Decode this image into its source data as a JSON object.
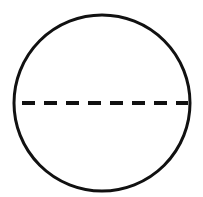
{
  "diagram": {
    "background": "#ffffff",
    "stroke_color": "#111111",
    "circle": {
      "cx": 102,
      "cy": 103,
      "r": 88,
      "stroke_width": 3
    },
    "diameter": {
      "x1": 22,
      "x2": 188,
      "y": 103,
      "stroke_width": 4,
      "dash": 13,
      "gap": 9,
      "style": "dashed"
    }
  }
}
